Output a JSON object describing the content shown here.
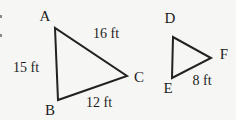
{
  "diagram": {
    "large_triangle": {
      "name": "ABC",
      "vertices": [
        "A",
        "B",
        "C"
      ],
      "sides": [
        {
          "from": "A",
          "to": "C",
          "length": "16 ft"
        },
        {
          "from": "A",
          "to": "B",
          "length": "15 ft"
        },
        {
          "from": "B",
          "to": "C",
          "length": "12 ft"
        }
      ]
    },
    "small_triangle": {
      "name": "DEF",
      "vertices": [
        "D",
        "E",
        "F"
      ],
      "sides": [
        {
          "from": "E",
          "to": "F",
          "length": "8 ft"
        }
      ]
    }
  },
  "colors": {
    "background": "#f6f6f4",
    "line": "#222222",
    "text": "#1c1c1c",
    "edge_fragment": "#8a8a8a"
  }
}
